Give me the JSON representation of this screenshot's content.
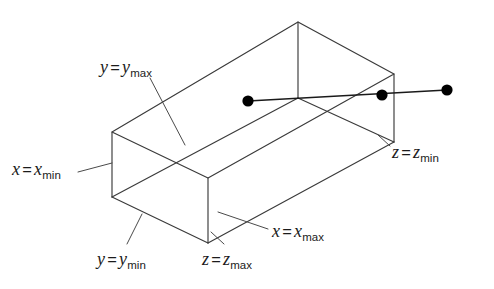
{
  "figure": {
    "stroke_color": "#3a3a3a",
    "ray_color": "#1a1a1a",
    "dot_color": "#000000",
    "background": "#ffffff"
  },
  "labels": {
    "y_max": {
      "var": "y",
      "eq": "=",
      "value_var": "y",
      "sub": "max",
      "x": 100,
      "y": 58
    },
    "x_min": {
      "var": "x",
      "eq": "=",
      "value_var": "x",
      "sub": "min",
      "x": 12,
      "y": 160
    },
    "y_min": {
      "var": "y",
      "eq": "=",
      "value_var": "y",
      "sub": "min",
      "x": 97,
      "y": 250
    },
    "z_max": {
      "var": "z",
      "eq": "=",
      "value_var": "z",
      "sub": "max",
      "x": 202,
      "y": 250
    },
    "x_max": {
      "var": "x",
      "eq": "=",
      "value_var": "x",
      "sub": "max",
      "x": 272,
      "y": 222
    },
    "z_min": {
      "var": "z",
      "eq": "=",
      "value_var": "z",
      "sub": "min",
      "x": 392,
      "y": 143
    }
  },
  "box": {
    "type": "parallelepiped-wireframe",
    "vertices": {
      "front_left_top": [
        112,
        132
      ],
      "front_left_bottom": [
        112,
        197
      ],
      "front_bottom": [
        208,
        243
      ],
      "front_top": [
        208,
        178
      ],
      "back_top_apex": [
        298,
        22
      ],
      "inner_top": [
        298,
        98
      ],
      "right_top": [
        394,
        74
      ],
      "right_bottom": [
        394,
        142
      ],
      "back_bottom_right": [
        298,
        188
      ]
    }
  },
  "ray": {
    "points": [
      {
        "name": "entry-point",
        "x": 248,
        "y": 101,
        "r": 5.6
      },
      {
        "name": "exit-point",
        "x": 382,
        "y": 95,
        "r": 5.6
      },
      {
        "name": "origin-point",
        "x": 447,
        "y": 90,
        "r": 5.6
      }
    ],
    "segment_from": [
      248,
      101
    ],
    "segment_to": [
      447,
      90
    ]
  },
  "leaders": {
    "y_max": [
      [
        150,
        78
      ],
      [
        185,
        145
      ]
    ],
    "x_min": [
      [
        78,
        172
      ],
      [
        112,
        163
      ]
    ],
    "y_min": [
      [
        127,
        244
      ],
      [
        142,
        214
      ]
    ],
    "z_max": [
      [
        224,
        244
      ],
      [
        211,
        232
      ]
    ],
    "x_max": [
      [
        268,
        229
      ],
      [
        218,
        212
      ]
    ],
    "z_min": [
      [
        390,
        146
      ],
      [
        378,
        135
      ]
    ]
  }
}
